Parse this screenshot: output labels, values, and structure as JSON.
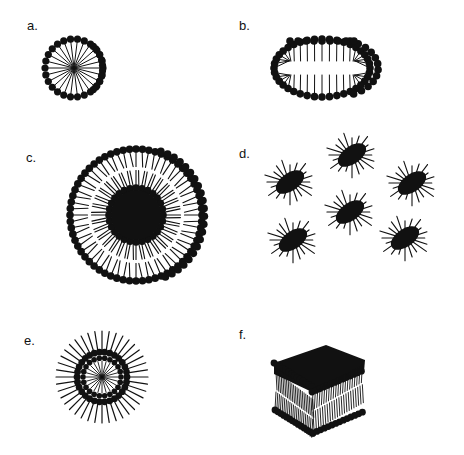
{
  "figure": {
    "panels": [
      {
        "id": "a",
        "label": "a.",
        "structure": "spherical micelle"
      },
      {
        "id": "b",
        "label": "b.",
        "structure": "ellipsoidal / cylindrical micelle"
      },
      {
        "id": "c",
        "label": "c.",
        "structure": "bilayer vesicle (liposome)"
      },
      {
        "id": "d",
        "label": "d.",
        "structure": "reverse micelles (multiple)"
      },
      {
        "id": "e",
        "label": "e.",
        "structure": "inverted / reverse spherical micelle"
      },
      {
        "id": "f",
        "label": "f.",
        "structure": "planar lipid bilayer"
      }
    ],
    "colors": {
      "head": "#111111",
      "tail": "#111111",
      "background": "#ffffff"
    }
  }
}
